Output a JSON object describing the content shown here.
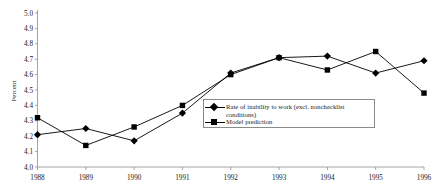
{
  "chart_data": {
    "type": "line",
    "title": "",
    "subtitle": "",
    "xlabel": "",
    "ylabel": "Percent",
    "categories": [
      "1988",
      "1989",
      "1990",
      "1991",
      "1992",
      "1993",
      "1994",
      "1995",
      "1996"
    ],
    "x": [
      1988,
      1989,
      1990,
      1991,
      1992,
      1993,
      1994,
      1995,
      1996
    ],
    "ylim": [
      4.0,
      5.0
    ],
    "ytick_step": 0.1,
    "ytick_labels": [
      "4.0",
      "4.1",
      "4.2",
      "4.3",
      "4.4",
      "4.5",
      "4.6",
      "4.7",
      "4.8",
      "4.9",
      "5.0"
    ],
    "ytick_values": [
      4.0,
      4.1,
      4.2,
      4.3,
      4.4,
      4.5,
      4.6,
      4.7,
      4.8,
      4.9,
      5.0
    ],
    "grid": false,
    "legend_position": "inside-lower-right",
    "series": [
      {
        "name": "Rate of inability to work (excl. nonchecklist conditions)",
        "marker": "diamond",
        "color": "#000000",
        "values": [
          4.21,
          4.25,
          4.17,
          4.35,
          4.61,
          4.71,
          4.72,
          4.61,
          4.69
        ]
      },
      {
        "name": "Model prediction",
        "marker": "square",
        "color": "#000000",
        "values": [
          4.32,
          4.14,
          4.26,
          4.4,
          4.6,
          4.71,
          4.63,
          4.75,
          4.48
        ]
      }
    ]
  },
  "legend": {
    "items": [
      {
        "label": "Rate of inability to work (excl. nonchecklist conditions)",
        "marker": "diamond"
      },
      {
        "label": "Model prediction",
        "marker": "square"
      }
    ]
  },
  "axes": {
    "y_title": "Percent"
  },
  "colors": {
    "series": "#000000",
    "axis": "#9a9a9a",
    "legend_border": "#8a8a8a",
    "background": "#ffffff"
  }
}
